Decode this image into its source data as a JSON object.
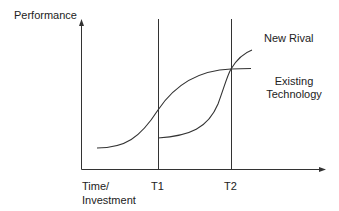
{
  "diagram": {
    "y_axis_label": "Performance",
    "x_axis_label_line1": "Time/",
    "x_axis_label_line2": "Investment",
    "markers": [
      {
        "label": "T1"
      },
      {
        "label": "T2"
      }
    ],
    "curves": [
      {
        "name": "New Rival",
        "label": "New Rival"
      },
      {
        "name": "Existing Technology",
        "label_line1": "Existing",
        "label_line2": "Technology"
      }
    ],
    "colors": {
      "line": "#333333",
      "text": "#222222",
      "background": "#ffffff"
    }
  }
}
